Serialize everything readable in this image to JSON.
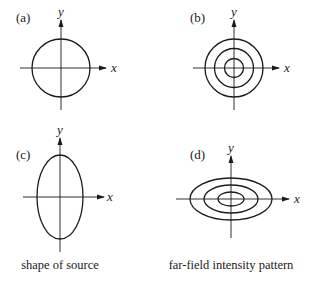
{
  "panels": [
    {
      "id": "a",
      "label": "(a)",
      "x_axis_label": "x",
      "y_axis_label": "y",
      "shape": "circle",
      "description": "single circle"
    },
    {
      "id": "b",
      "label": "(b)",
      "x_axis_label": "x",
      "y_axis_label": "y",
      "shape": "concentric circles",
      "rings": 3
    },
    {
      "id": "c",
      "label": "(c)",
      "x_axis_label": "x",
      "y_axis_label": "y",
      "shape": "vertical ellipse",
      "description": "ellipse elongated along y"
    },
    {
      "id": "d",
      "label": "(d)",
      "x_axis_label": "x",
      "y_axis_label": "y",
      "shape": "concentric horizontal ellipses",
      "rings": 3
    }
  ],
  "captions": {
    "left": "shape of source",
    "right": "far-field intensity pattern"
  }
}
